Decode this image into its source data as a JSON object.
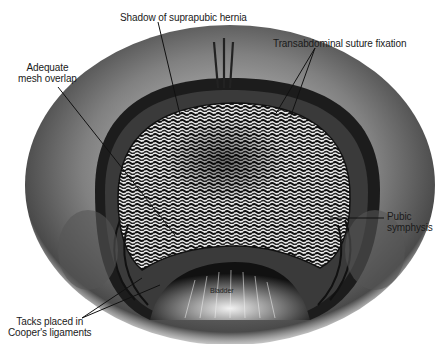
{
  "figure": {
    "colors": {
      "ink": "#1a1a1a",
      "shade": "#5a5a5a",
      "light": "#bdbdbd",
      "paper": "#ffffff"
    }
  },
  "labels": {
    "shadow": "Shadow of suprapubic hernia",
    "overlap_line1": "Adequate",
    "overlap_line2": "mesh overlap",
    "suture": "Transabdominal suture fixation",
    "pubic_line1": "Pubic",
    "pubic_line2": "symphysis",
    "tacks_line1": "Tacks placed in",
    "tacks_line2": "Cooper's ligaments",
    "bladder": "Bladder"
  }
}
